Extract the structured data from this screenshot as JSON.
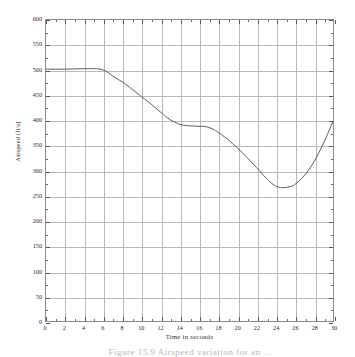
{
  "figure": {
    "caption": "Figure 15.9    Airspeed variation for an ...",
    "background_color": "#ffffff",
    "frame_color": "#8c8c8c",
    "grid_color": "#b9b9b9",
    "curve_color": "#4a4a4a"
  },
  "chart_data": {
    "type": "line",
    "title": "",
    "xlabel": "Time in seconds",
    "ylabel": "Airspeed  (ft/s)",
    "xlim": [
      0,
      30
    ],
    "ylim": [
      0,
      600
    ],
    "grid": true,
    "legend": null,
    "xticks": [
      0,
      2,
      4,
      6,
      8,
      10,
      12,
      14,
      16,
      18,
      20,
      22,
      24,
      26,
      28,
      30
    ],
    "xtick_labels": [
      "0",
      "2",
      "4",
      "6",
      "8",
      "10",
      "12",
      "14",
      "16",
      "18",
      "20",
      "22",
      "24",
      "26",
      "28",
      "30"
    ],
    "xminor_step": 1,
    "yticks": [
      0,
      50,
      100,
      150,
      200,
      250,
      300,
      350,
      400,
      450,
      500,
      550,
      600
    ],
    "ytick_labels": [
      "0",
      "50",
      "100",
      "150",
      "200",
      "250",
      "300",
      "350",
      "400",
      "450",
      "500",
      "550",
      "600"
    ],
    "yminor_step": 25,
    "series": [
      {
        "name": "Airspeed",
        "x": [
          0,
          1,
          2,
          3,
          4,
          5,
          5.5,
          6,
          6.5,
          7,
          7.5,
          8,
          9,
          10,
          11,
          12,
          12.5,
          13,
          13.5,
          14,
          14.5,
          15,
          15.5,
          16,
          16.5,
          17,
          17.5,
          18,
          19,
          20,
          21,
          22,
          23,
          23.5,
          24,
          24.5,
          25,
          25.5,
          26,
          27,
          28,
          29,
          30
        ],
        "y": [
          502,
          502,
          502,
          502.5,
          503,
          503,
          502.5,
          500,
          495,
          488,
          482,
          476,
          462,
          447,
          432,
          416,
          408,
          401,
          396,
          392,
          390,
          389,
          388.5,
          388,
          388,
          386,
          382,
          376,
          362,
          345,
          326,
          306,
          285,
          276,
          269,
          266,
          266,
          268,
          272,
          290,
          317,
          354,
          398
        ]
      }
    ],
    "annotations": [],
    "min_point": {
      "x": 24.5,
      "y": 266
    },
    "start_point": {
      "x": 0,
      "y": 502
    },
    "end_point": {
      "x": 30,
      "y": 398
    }
  }
}
